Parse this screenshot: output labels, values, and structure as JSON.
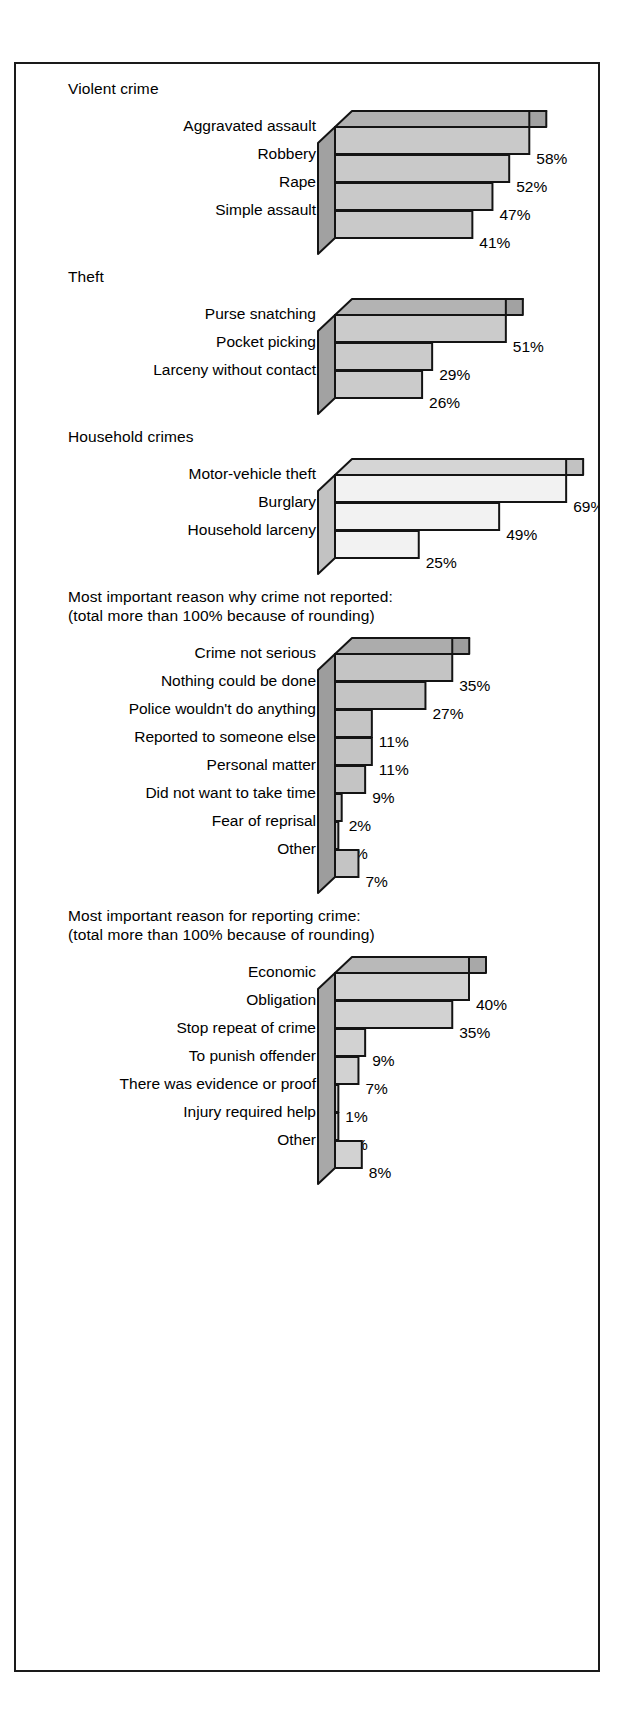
{
  "figure": {
    "background": "#ffffff",
    "border_color": "#1a1a1a"
  },
  "chart_data": {
    "type": "bar",
    "title": "",
    "xlabel": "",
    "ylabel": "",
    "orientation": "horizontal",
    "style": "3d-isometric-bars",
    "value_suffix": "%",
    "xlim": [
      0,
      70
    ],
    "grid": false,
    "legend": false,
    "groups": [
      {
        "id": "violent-crime",
        "title": "Violent crime",
        "subtitle": "",
        "fill": "#c9c9c9",
        "categories": [
          "Aggravated assault",
          "Robbery",
          "Rape",
          "Simple assault"
        ],
        "values": [
          58,
          52,
          47,
          41
        ],
        "value_labels": [
          "58%",
          "52%",
          "47%",
          "41%"
        ]
      },
      {
        "id": "theft",
        "title": "Theft",
        "subtitle": "",
        "fill": "#cbcbcb",
        "categories": [
          "Purse snatching",
          "Pocket picking",
          "Larceny without contact"
        ],
        "values": [
          51,
          29,
          26
        ],
        "value_labels": [
          "51%",
          "29%",
          "26%"
        ]
      },
      {
        "id": "household-crimes",
        "title": "Household crimes",
        "subtitle": "",
        "fill": "#f2f2f2",
        "categories": [
          "Motor-vehicle theft",
          "Burglary",
          "Household larceny"
        ],
        "values": [
          69,
          49,
          25
        ],
        "value_labels": [
          "69%",
          "49%",
          "25%"
        ]
      },
      {
        "id": "reason-not-reported",
        "title": "Most important reason why crime not reported:",
        "subtitle": "(total more than 100% because of rounding)",
        "fill": "#c4c4c4",
        "categories": [
          "Crime not serious",
          "Nothing could be done",
          "Police wouldn't do anything",
          "Reported to someone else",
          "Personal matter",
          "Did not want to take time",
          "Fear of reprisal",
          "Other"
        ],
        "values": [
          35,
          27,
          11,
          11,
          9,
          2,
          1,
          7
        ],
        "value_labels": [
          "35%",
          "27%",
          "11%",
          "11%",
          "9%",
          "2%",
          "1%",
          "7%"
        ]
      },
      {
        "id": "reason-for-reporting",
        "title": "Most important reason for reporting crime:",
        "subtitle": "(total more than 100% because of rounding)",
        "fill": "#d2d2d2",
        "categories": [
          "Economic",
          "Obligation",
          "Stop repeat of crime",
          "To punish offender",
          "There was evidence or proof",
          "Injury required help",
          "Other"
        ],
        "values": [
          40,
          35,
          9,
          7,
          1,
          1,
          8
        ],
        "value_labels": [
          "40%",
          "35%",
          "9%",
          "7%",
          "1%",
          "1%",
          "8%"
        ]
      }
    ]
  }
}
